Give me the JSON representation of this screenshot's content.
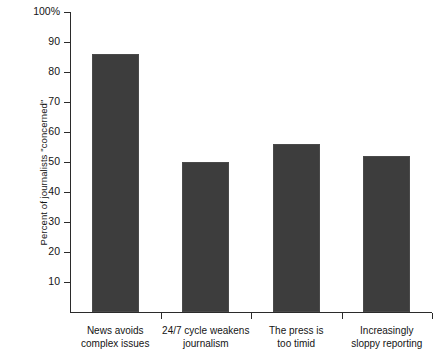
{
  "chart_data": {
    "type": "bar",
    "title": "",
    "xlabel": "",
    "ylabel": "Percent of journalists \"concerned\"",
    "ylim": [
      0,
      100
    ],
    "yticks": [
      10,
      20,
      30,
      40,
      50,
      60,
      70,
      80,
      90,
      100
    ],
    "ytick_labels": [
      "10",
      "20",
      "30",
      "40",
      "50",
      "60",
      "70",
      "80",
      "90",
      "100%"
    ],
    "grid": false,
    "legend": null,
    "bar_color": "#3d3d3d",
    "background_color": "#ffffff",
    "axis_color": "#2b2b2b",
    "categories": [
      "News avoids complex issues",
      "24/7 cycle weakens journalism",
      "The press is too timid",
      "Increasingly sloppy reporting"
    ],
    "category_lines": [
      [
        "News avoids",
        "complex issues"
      ],
      [
        "24/7 cycle weakens",
        "journalism"
      ],
      [
        "The press is",
        "too timid"
      ],
      [
        "Increasingly",
        "sloppy reporting"
      ]
    ],
    "values": [
      86,
      50,
      56,
      52
    ]
  }
}
